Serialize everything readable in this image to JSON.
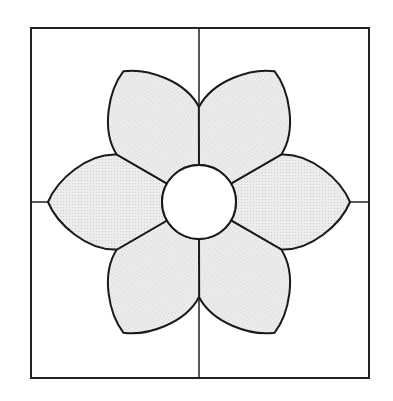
{
  "diagram": {
    "title": "Six-petal flower block pattern",
    "frame": {
      "x": 31,
      "y": 28,
      "width": 338,
      "height": 350,
      "stroke": "#222222"
    },
    "center": {
      "x": 199,
      "y": 202,
      "radius": 37,
      "fill": "#ffffff"
    },
    "petals": {
      "count": 6,
      "angles": [
        0,
        60,
        120,
        180,
        240,
        300
      ],
      "fill": "#e6e6e6",
      "stroke": "#1a1a1a"
    },
    "grid_lines": {
      "vertical_x": 199,
      "horizontal_y": 202
    }
  }
}
